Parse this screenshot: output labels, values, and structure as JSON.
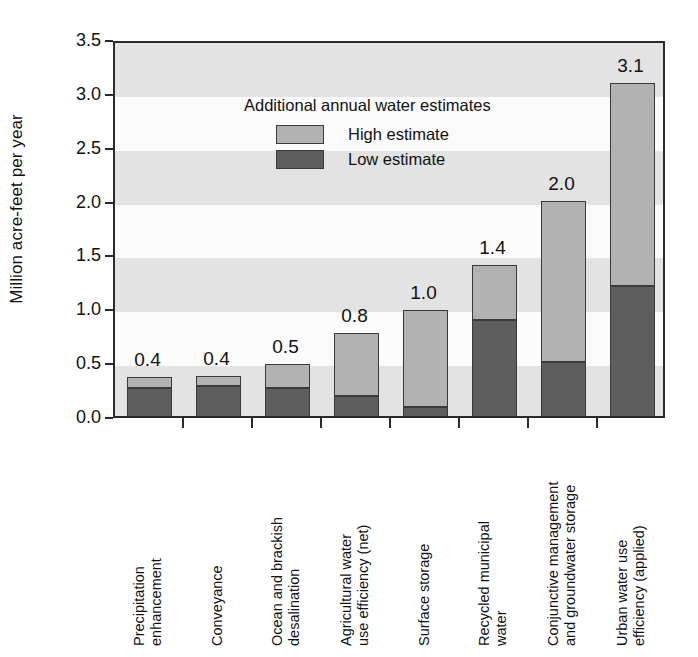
{
  "chart_data": {
    "type": "bar",
    "subtype": "stacked-range",
    "title": "",
    "xlabel": "",
    "ylabel": "Million acre-feet per year",
    "ylim": [
      0.0,
      3.5
    ],
    "ytick_labels": [
      "0.0",
      "0.5",
      "1.0",
      "1.5",
      "2.0",
      "2.5",
      "3.0",
      "3.5"
    ],
    "ytick_values": [
      0.0,
      0.5,
      1.0,
      1.5,
      2.0,
      2.5,
      3.0,
      3.5
    ],
    "grid": "alternating-horizontal-bands",
    "legend": {
      "position": "inside-top-left",
      "title": "Additional annual water estimates",
      "entries": [
        {
          "label": "High estimate",
          "color": "#b2b2b2"
        },
        {
          "label": "Low estimate",
          "color": "#5e5e5e"
        }
      ]
    },
    "categories": [
      "Precipitation enhancement",
      "Conveyance",
      "Ocean and brackish desalination",
      "Agricultural water use efficiency (net)",
      "Surface storage",
      "Recycled municipal water",
      "Conjunctive management and groundwater storage",
      "Urban water use efficiency (applied)"
    ],
    "category_lines": [
      [
        "Precipitation",
        "enhancement"
      ],
      [
        "Conveyance",
        ""
      ],
      [
        "Ocean and brackish",
        "desalination"
      ],
      [
        "Agricultural water",
        "use efficiency (net)"
      ],
      [
        "Surface storage",
        ""
      ],
      [
        "Recycled municipal",
        "water"
      ],
      [
        "Conjunctive management",
        "and groundwater storage"
      ],
      [
        "Urban water use",
        "efficiency (applied)"
      ]
    ],
    "series": [
      {
        "name": "Low estimate",
        "values": [
          0.3,
          0.32,
          0.3,
          0.22,
          0.12,
          0.93,
          0.54,
          1.24
        ]
      },
      {
        "name": "High estimate",
        "values": [
          0.4,
          0.41,
          0.52,
          0.81,
          1.02,
          1.44,
          2.03,
          3.13
        ]
      }
    ],
    "data_labels": [
      "0.4",
      "0.4",
      "0.5",
      "0.8",
      "1.0",
      "1.4",
      "2.0",
      "3.1"
    ]
  },
  "colors": {
    "high": "#b2b2b2",
    "low": "#5e5e5e",
    "axis": "#2a2a2a",
    "band": "#e3e3e3",
    "plot_bg": "#fbfbfb"
  }
}
